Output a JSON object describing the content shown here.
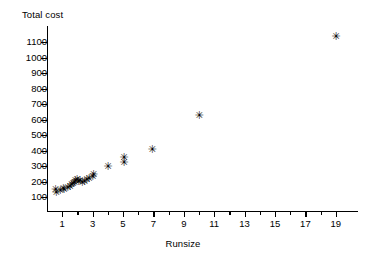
{
  "chart_data": {
    "type": "scatter",
    "title": "",
    "ylabel": "Total cost",
    "xlabel": "Runsize",
    "xlim": [
      0,
      20
    ],
    "ylim": [
      55,
      1180
    ],
    "grid": false,
    "legend": null,
    "marker": "star",
    "marker_color": "#000000",
    "y_ticks": [
      100,
      200,
      300,
      400,
      500,
      600,
      700,
      800,
      900,
      1000,
      1100
    ],
    "x_ticks_major": [
      1,
      3,
      5,
      7,
      9,
      11,
      13,
      15,
      17,
      19
    ],
    "x_ticks_minor": [
      2,
      4,
      6,
      8,
      10,
      12,
      14,
      16,
      18
    ],
    "points": [
      {
        "x": 0.55,
        "y": 140
      },
      {
        "x": 0.6,
        "y": 125
      },
      {
        "x": 0.85,
        "y": 135
      },
      {
        "x": 1.05,
        "y": 150
      },
      {
        "x": 1.1,
        "y": 142
      },
      {
        "x": 1.35,
        "y": 155
      },
      {
        "x": 1.5,
        "y": 160
      },
      {
        "x": 1.6,
        "y": 172
      },
      {
        "x": 1.7,
        "y": 178
      },
      {
        "x": 1.8,
        "y": 188
      },
      {
        "x": 1.85,
        "y": 200
      },
      {
        "x": 1.95,
        "y": 205
      },
      {
        "x": 2.05,
        "y": 195
      },
      {
        "x": 2.15,
        "y": 200
      },
      {
        "x": 2.3,
        "y": 185
      },
      {
        "x": 2.45,
        "y": 192
      },
      {
        "x": 2.6,
        "y": 205
      },
      {
        "x": 2.75,
        "y": 215
      },
      {
        "x": 3.0,
        "y": 228
      },
      {
        "x": 3.05,
        "y": 238
      },
      {
        "x": 4.0,
        "y": 290
      },
      {
        "x": 5.05,
        "y": 315
      },
      {
        "x": 5.05,
        "y": 350
      },
      {
        "x": 6.9,
        "y": 400
      },
      {
        "x": 10.0,
        "y": 620
      },
      {
        "x": 19.0,
        "y": 1130
      }
    ]
  }
}
